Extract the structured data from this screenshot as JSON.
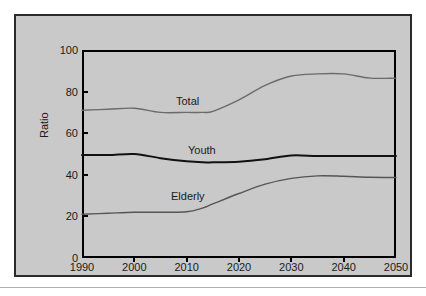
{
  "chart_data": {
    "type": "line",
    "title": "",
    "xlabel": "",
    "ylabel": "Ratio",
    "xlim": [
      1990,
      2050
    ],
    "ylim": [
      0,
      100
    ],
    "grid": false,
    "legend_position": "inline-labels",
    "xticks": [
      "1990",
      "2000",
      "2010",
      "2020",
      "2030",
      "2040",
      "2050"
    ],
    "yticks": [
      "0",
      "20",
      "40",
      "60",
      "80",
      "100"
    ],
    "x": [
      1990,
      1995,
      2000,
      2005,
      2010,
      2013,
      2015,
      2020,
      2025,
      2030,
      2035,
      2040,
      2045,
      2050
    ],
    "series": [
      {
        "name": "Total",
        "color": "#6b6b6b",
        "values": [
          71.0,
          71.5,
          72.0,
          70.0,
          70.0,
          70.0,
          70.5,
          76.0,
          83.0,
          87.5,
          88.5,
          88.5,
          86.5,
          86.5
        ]
      },
      {
        "name": "Youth",
        "color": "#111111",
        "values": [
          49.5,
          49.5,
          50.0,
          48.0,
          46.5,
          46.0,
          46.0,
          46.3,
          47.5,
          49.3,
          49.0,
          49.0,
          49.0,
          49.0
        ]
      },
      {
        "name": "Elderly",
        "color": "#555555",
        "values": [
          21.0,
          21.5,
          22.0,
          22.0,
          22.2,
          24.0,
          26.0,
          31.0,
          35.5,
          38.3,
          39.5,
          39.3,
          38.8,
          38.7
        ]
      }
    ]
  },
  "series_labels": {
    "total": "Total",
    "youth": "Youth",
    "elderly": "Elderly"
  }
}
